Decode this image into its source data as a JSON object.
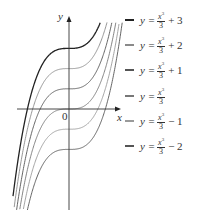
{
  "chart_data": {
    "type": "line",
    "title": "",
    "xlabel": "x",
    "ylabel": "y",
    "origin_label": "0",
    "grid": false,
    "legend_position": "right",
    "x_range": [
      -2.6,
      2.6
    ],
    "y_range": [
      -5.0,
      4.6
    ],
    "function": "y = x^3/3 + C",
    "series": [
      {
        "name": "y = x³/3 + 3",
        "C": 3,
        "color": "#222222",
        "num": "x",
        "exp": "3",
        "den": "3",
        "tail": "+ 3"
      },
      {
        "name": "y = x³/3 + 2",
        "C": 2,
        "color": "#8a8a8a",
        "num": "x",
        "exp": "3",
        "den": "3",
        "tail": "+ 2"
      },
      {
        "name": "y = x³/3 + 1",
        "C": 1,
        "color": "#555555",
        "num": "x",
        "exp": "3",
        "den": "3",
        "tail": "+ 1"
      },
      {
        "name": "y = x³/3",
        "C": 0,
        "color": "#777777",
        "num": "x",
        "exp": "3",
        "den": "3",
        "tail": ""
      },
      {
        "name": "y = x³/3 − 1",
        "C": -1,
        "color": "#9a9a9a",
        "num": "x",
        "exp": "3",
        "den": "3",
        "tail": "− 1"
      },
      {
        "name": "y = x³/3 − 2",
        "C": -2,
        "color": "#555555",
        "num": "x",
        "exp": "3",
        "den": "3",
        "tail": "− 2"
      }
    ],
    "sample_points_C0": {
      "x": [
        -2,
        -1,
        0,
        1,
        2
      ],
      "y": [
        -2.67,
        -0.33,
        0,
        0.33,
        2.67
      ]
    }
  },
  "legend": {
    "lhs": "y =",
    "items": [
      {
        "tail": "+ 3"
      },
      {
        "tail": "+ 2"
      },
      {
        "tail": "+ 1"
      },
      {
        "tail": ""
      },
      {
        "tail": "− 1"
      },
      {
        "tail": "− 2"
      }
    ]
  },
  "axes": {
    "x_label": "x",
    "y_label": "y",
    "origin": "0"
  }
}
